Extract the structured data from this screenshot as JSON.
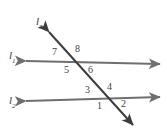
{
  "figure": {
    "kind": "geometry-diagram",
    "background_color": "#ffffff",
    "width": 167,
    "height": 132
  },
  "colors": {
    "parallel_line": "#6f6f6f",
    "transversal_line": "#3d3d3d",
    "label_text": "#3a3a3a",
    "angle_text": "#3f3f3f"
  },
  "lines": [
    {
      "id": "l1",
      "label_text": "l",
      "label_sub": "1",
      "role": "upper-parallel-line",
      "x1": 26,
      "y1": 61,
      "x2": 160,
      "y2": 64,
      "arrows": "both",
      "color": "#6f6f6f",
      "width": 2.0
    },
    {
      "id": "l2",
      "label_text": "l",
      "label_sub": "2",
      "role": "lower-parallel-line",
      "x1": 26,
      "y1": 101,
      "x2": 160,
      "y2": 97,
      "arrows": "both",
      "color": "#6f6f6f",
      "width": 2.0
    },
    {
      "id": "l3",
      "label_text": "l",
      "label_sub": "3",
      "role": "transversal-line",
      "x1": 49,
      "y1": 32,
      "x2": 133,
      "y2": 125,
      "arrows": "both",
      "color": "#3d3d3d",
      "width": 2.0
    }
  ],
  "line_labels": [
    {
      "id": "label-l3",
      "text": "l",
      "sub": "3",
      "x": 36,
      "y": 16
    },
    {
      "id": "label-l1",
      "text": "l",
      "sub": "1",
      "x": 9,
      "y": 50
    },
    {
      "id": "label-l2",
      "text": "l",
      "sub": "2",
      "x": 9,
      "y": 95
    }
  ],
  "intersections": [
    {
      "id": "upper-intersection",
      "of": [
        "l1",
        "l3"
      ],
      "x": 78,
      "y": 62,
      "angles": [
        {
          "number": "7",
          "position": "upper-left",
          "x": 52,
          "y": 47
        },
        {
          "number": "8",
          "position": "upper-right",
          "x": 75,
          "y": 44
        },
        {
          "number": "5",
          "position": "lower-left",
          "x": 64,
          "y": 65
        },
        {
          "number": "6",
          "position": "lower-right",
          "x": 88,
          "y": 65
        }
      ]
    },
    {
      "id": "lower-intersection",
      "of": [
        "l2",
        "l3"
      ],
      "x": 109,
      "y": 99,
      "angles": [
        {
          "number": "3",
          "position": "upper-left",
          "x": 85,
          "y": 85
        },
        {
          "number": "4",
          "position": "upper-right",
          "x": 107,
          "y": 82
        },
        {
          "number": "1",
          "position": "lower-left",
          "x": 97,
          "y": 101
        },
        {
          "number": "2",
          "position": "lower-right",
          "x": 121,
          "y": 99
        }
      ]
    }
  ],
  "angle_numbers": [
    "1",
    "2",
    "3",
    "4",
    "5",
    "6",
    "7",
    "8"
  ]
}
